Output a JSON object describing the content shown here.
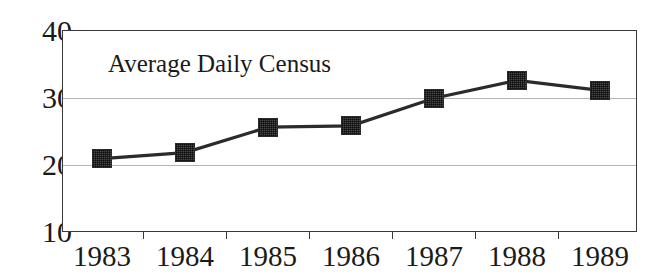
{
  "chart_data": {
    "type": "line",
    "title": "Average Daily Census",
    "xlabel": "",
    "ylabel": "",
    "categories": [
      "1983",
      "1984",
      "1985",
      "1986",
      "1987",
      "1988",
      "1989"
    ],
    "values": [
      20.8,
      21.7,
      25.5,
      25.7,
      29.8,
      32.5,
      31.0
    ],
    "series": [
      {
        "name": "Average Daily Census",
        "values": [
          20.8,
          21.7,
          25.5,
          25.7,
          29.8,
          32.5,
          31.0
        ]
      }
    ],
    "ylim": [
      10,
      40
    ],
    "yticks": [
      10,
      20,
      30,
      40
    ],
    "ytick_labels": [
      "10",
      "20",
      "30",
      "40"
    ],
    "grid": true,
    "gridlines_at": [
      20,
      30
    ],
    "legend": "none",
    "legend_position": "none",
    "marker": "filled-square",
    "line_color": "#2b2b2b",
    "marker_color": "#4a4a4a",
    "grid_color": "#b4b4b4",
    "axis_color": "#3a3a3a",
    "background_color": "#ffffff",
    "annotations": [
      {
        "text": "Average Daily Census",
        "position": "inside-top-left"
      }
    ]
  }
}
